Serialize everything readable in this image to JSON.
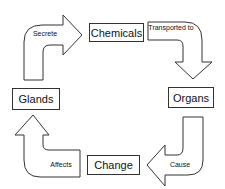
{
  "diagram": {
    "type": "cycle",
    "nodes": [
      {
        "id": "glands",
        "label": "Glands"
      },
      {
        "id": "chemicals",
        "label": "Chemicals"
      },
      {
        "id": "organs",
        "label": "Organs"
      },
      {
        "id": "change",
        "label": "Change"
      }
    ],
    "edges": [
      {
        "from": "glands",
        "to": "chemicals",
        "label": "Secrete"
      },
      {
        "from": "chemicals",
        "to": "organs",
        "label": "Transported to"
      },
      {
        "from": "organs",
        "to": "change",
        "label": "Cause"
      },
      {
        "from": "change",
        "to": "glands",
        "label": "Affects"
      }
    ],
    "colors": {
      "stroke": "#333333",
      "fill": "#ffffff"
    }
  }
}
